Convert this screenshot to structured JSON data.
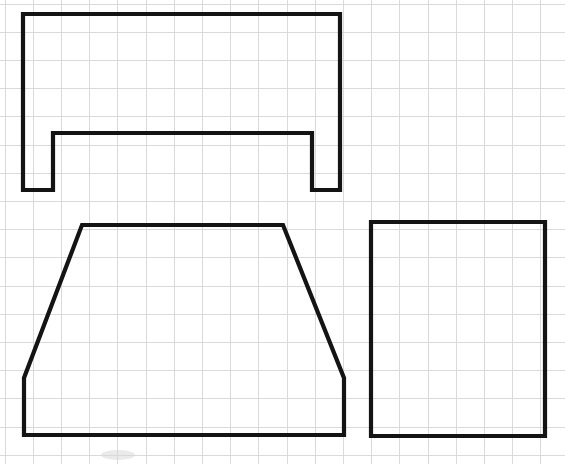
{
  "sheet": {
    "title": "Orthographic Views on Graph Paper",
    "width": 565,
    "height": 464,
    "background_color": "#ffffff",
    "description": "Three hand-drawn engineering outlines on light blue-gray graph paper"
  },
  "grid": {
    "name": "graph-paper-grid",
    "color": "#d6d6d8",
    "major_color": "#c9c9cc",
    "spacing_px": 28.2,
    "origin_x": 5.0,
    "origin_y": 4.0,
    "stroke_width": 0.9,
    "visible": true
  },
  "drawing": {
    "stroke_color": "#141414",
    "stroke_width": 4.2,
    "fill": "none",
    "line_style": "solid"
  },
  "shapes": [
    {
      "id": "channel-section",
      "name": "channel-u-section-view",
      "label": "Channel Section",
      "type": "polygon",
      "closed": true,
      "points": "23,14 340,14 340,190 312,190 312,133 53,133 53,190 23,190",
      "vertices": [
        [
          23,
          14
        ],
        [
          340,
          14
        ],
        [
          340,
          190
        ],
        [
          312,
          190
        ],
        [
          312,
          133
        ],
        [
          53,
          133
        ],
        [
          53,
          190
        ],
        [
          23,
          190
        ]
      ],
      "bounds": {
        "x": 23,
        "y": 14,
        "width": 317,
        "height": 176
      },
      "notes": "Inverted U / channel with two downward legs and a web across the top"
    },
    {
      "id": "trapezoid-section",
      "name": "trapezoid-front-view",
      "label": "Trapezoid",
      "type": "polygon",
      "closed": true,
      "points": "82,225 283,225 344,378 344,435 24,435 24,378",
      "vertices": [
        [
          82,
          225
        ],
        [
          283,
          225
        ],
        [
          344,
          378
        ],
        [
          344,
          435
        ],
        [
          24,
          435
        ],
        [
          24,
          378
        ]
      ],
      "bounds": {
        "x": 24,
        "y": 225,
        "width": 320,
        "height": 210
      },
      "notes": "Trapezoid with short vertical flanks at the lower left and lower right"
    },
    {
      "id": "rectangle-section",
      "name": "rectangle-side-view",
      "label": "Rectangle",
      "type": "polygon",
      "closed": true,
      "points": "371,222 545,222 545,436 371,436",
      "vertices": [
        [
          371,
          222
        ],
        [
          545,
          222
        ],
        [
          545,
          436
        ],
        [
          371,
          436
        ]
      ],
      "bounds": {
        "x": 371,
        "y": 222,
        "width": 174,
        "height": 214
      },
      "notes": "Plain rectangle, slightly taller than wide"
    }
  ],
  "marks": [
    {
      "id": "smudge-1",
      "name": "pencil-smudge-artifact",
      "cx": 118,
      "cy": 455,
      "rx": 17,
      "ry": 5,
      "opacity": 0.5
    }
  ]
}
